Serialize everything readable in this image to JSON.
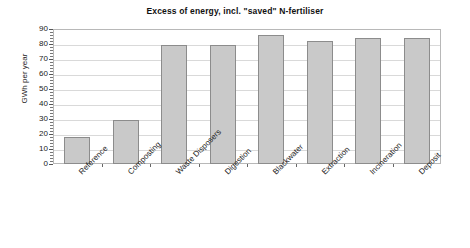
{
  "chart_data": {
    "type": "bar",
    "title": "Excess of energy, incl. \"saved\" N-fertiliser",
    "xlabel": "",
    "ylabel": "GWh per year",
    "ylim": [
      0,
      90
    ],
    "ytick_step": 10,
    "grid": true,
    "legend": "none",
    "categories": [
      "Reference",
      "Composting",
      "Waste Disposers",
      "Digestion",
      "Blackwater",
      "Extraction",
      "Incineration",
      "Deposit"
    ],
    "values": [
      18,
      29,
      79,
      79,
      86,
      82,
      84,
      84
    ],
    "yticks": [
      0,
      10,
      20,
      30,
      40,
      50,
      60,
      70,
      80,
      90
    ],
    "ytick_labels": [
      "0",
      "10",
      "20",
      "30",
      "40",
      "50",
      "60",
      "70",
      "80",
      "90"
    ],
    "colors": {
      "bar_fill": "#c9c9c9",
      "bar_border": "#8c8c8c",
      "gridline": "#d9d9d9",
      "frame": "#b8b8b8",
      "text": "#222222"
    }
  }
}
